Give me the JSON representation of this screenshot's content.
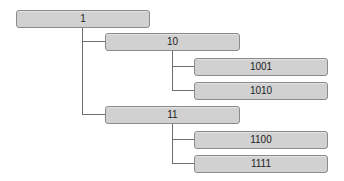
{
  "diagram": {
    "type": "tree",
    "nodes": {
      "root": {
        "label": "1"
      },
      "n10": {
        "label": "10"
      },
      "n1001": {
        "label": "1001"
      },
      "n1010": {
        "label": "1010"
      },
      "n11": {
        "label": "11"
      },
      "n1100": {
        "label": "1100"
      },
      "n1111": {
        "label": "1111"
      }
    },
    "edges": [
      [
        "1",
        "10"
      ],
      [
        "1",
        "11"
      ],
      [
        "10",
        "1001"
      ],
      [
        "10",
        "1010"
      ],
      [
        "11",
        "1100"
      ],
      [
        "11",
        "1111"
      ]
    ]
  }
}
